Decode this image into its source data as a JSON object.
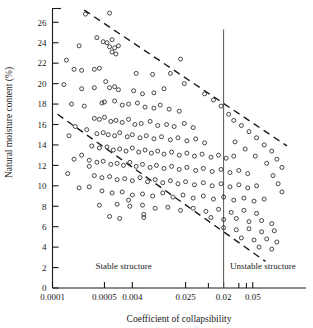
{
  "chart_data": {
    "type": "scatter",
    "title": "",
    "xlabel": "Coefficient  of  collapsibility",
    "ylabel": "Natural moisture content (%)",
    "xscale": "log-like-categorical",
    "x_ticks": [
      {
        "label": "0.0001",
        "pos": 0.0
      },
      {
        "label": "0.0005",
        "pos": 0.205
      },
      {
        "label": "0.004",
        "pos": 0.315
      },
      {
        "label": "0.025",
        "pos": 0.525
      },
      {
        "label": "0.02",
        "pos": 0.675
      },
      {
        "label": "0.05",
        "pos": 0.79
      }
    ],
    "x_minor_ticks": [
      0.615,
      0.735,
      0.765
    ],
    "y_ticks": [
      0,
      2,
      4,
      6,
      8,
      10,
      12,
      14,
      16,
      18,
      20,
      22,
      24,
      26
    ],
    "ylim": [
      0,
      27.4
    ],
    "grid": false,
    "legend": null,
    "annotations": [
      {
        "text": "Stable structure",
        "x": 0.17,
        "y": 1.9
      },
      {
        "text": "Unstable structure",
        "x": 0.7,
        "y": 1.9
      }
    ],
    "divider": {
      "label": "0.02",
      "x": 0.675,
      "y_top": 25.3,
      "y_bottom": 0
    },
    "trend_lines": [
      {
        "name": "upper-bound",
        "style": "dashed",
        "x1": 0.125,
        "y1": 27.2,
        "x2": 0.925,
        "y2": 13.9
      },
      {
        "name": "lower-bound",
        "style": "dashed",
        "x1": 0.02,
        "y1": 17.0,
        "x2": 0.84,
        "y2": 2.6
      }
    ],
    "points": [
      [
        0.13,
        26.8
      ],
      [
        0.225,
        26.9
      ],
      [
        0.175,
        24.5
      ],
      [
        0.2,
        24.1
      ],
      [
        0.215,
        24.0
      ],
      [
        0.235,
        24.3
      ],
      [
        0.225,
        23.6
      ],
      [
        0.245,
        23.5
      ],
      [
        0.26,
        23.7
      ],
      [
        0.235,
        23.1
      ],
      [
        0.25,
        22.9
      ],
      [
        0.105,
        23.7
      ],
      [
        0.055,
        22.3
      ],
      [
        0.085,
        21.4
      ],
      [
        0.115,
        21.3
      ],
      [
        0.165,
        21.4
      ],
      [
        0.185,
        21.5
      ],
      [
        0.33,
        21.0
      ],
      [
        0.395,
        20.9
      ],
      [
        0.045,
        19.9
      ],
      [
        0.115,
        19.5
      ],
      [
        0.165,
        19.6
      ],
      [
        0.21,
        20.2
      ],
      [
        0.225,
        19.6
      ],
      [
        0.245,
        19.7
      ],
      [
        0.26,
        19.4
      ],
      [
        0.32,
        19.3
      ],
      [
        0.355,
        19.0
      ],
      [
        0.4,
        19.1
      ],
      [
        0.44,
        19.5
      ],
      [
        0.075,
        18.0
      ],
      [
        0.125,
        17.8
      ],
      [
        0.195,
        18.1
      ],
      [
        0.205,
        18.2
      ],
      [
        0.245,
        18.3
      ],
      [
        0.275,
        17.9
      ],
      [
        0.3,
        18.0
      ],
      [
        0.335,
        18.1
      ],
      [
        0.365,
        17.7
      ],
      [
        0.4,
        17.6
      ],
      [
        0.425,
        17.9
      ],
      [
        0.46,
        17.5
      ],
      [
        0.5,
        17.3
      ],
      [
        0.165,
        16.6
      ],
      [
        0.185,
        16.5
      ],
      [
        0.205,
        16.7
      ],
      [
        0.23,
        16.3
      ],
      [
        0.25,
        16.4
      ],
      [
        0.275,
        16.2
      ],
      [
        0.3,
        16.5
      ],
      [
        0.325,
        16.0
      ],
      [
        0.35,
        16.1
      ],
      [
        0.385,
        16.3
      ],
      [
        0.415,
        15.9
      ],
      [
        0.45,
        16.0
      ],
      [
        0.48,
        15.8
      ],
      [
        0.52,
        16.1
      ],
      [
        0.555,
        15.7
      ],
      [
        0.09,
        15.8
      ],
      [
        0.135,
        15.5
      ],
      [
        0.175,
        15.1
      ],
      [
        0.2,
        15.2
      ],
      [
        0.22,
        15.0
      ],
      [
        0.245,
        14.9
      ],
      [
        0.265,
        15.2
      ],
      [
        0.295,
        14.8
      ],
      [
        0.315,
        15.0
      ],
      [
        0.345,
        14.7
      ],
      [
        0.37,
        14.9
      ],
      [
        0.4,
        14.6
      ],
      [
        0.43,
        14.8
      ],
      [
        0.465,
        14.5
      ],
      [
        0.495,
        14.7
      ],
      [
        0.53,
        14.4
      ],
      [
        0.565,
        14.6
      ],
      [
        0.6,
        14.2
      ],
      [
        0.155,
        13.9
      ],
      [
        0.185,
        13.7
      ],
      [
        0.215,
        13.8
      ],
      [
        0.24,
        13.5
      ],
      [
        0.265,
        13.6
      ],
      [
        0.29,
        13.4
      ],
      [
        0.315,
        13.7
      ],
      [
        0.34,
        13.3
      ],
      [
        0.365,
        13.5
      ],
      [
        0.39,
        13.2
      ],
      [
        0.415,
        13.4
      ],
      [
        0.44,
        13.1
      ],
      [
        0.47,
        13.3
      ],
      [
        0.5,
        13.0
      ],
      [
        0.53,
        13.2
      ],
      [
        0.56,
        12.9
      ],
      [
        0.59,
        13.1
      ],
      [
        0.625,
        12.8
      ],
      [
        0.655,
        13.0
      ],
      [
        0.685,
        12.7
      ],
      [
        0.715,
        12.9
      ],
      [
        0.145,
        12.5
      ],
      [
        0.175,
        12.3
      ],
      [
        0.2,
        12.4
      ],
      [
        0.23,
        12.1
      ],
      [
        0.255,
        12.2
      ],
      [
        0.28,
        12.0
      ],
      [
        0.305,
        12.3
      ],
      [
        0.33,
        11.9
      ],
      [
        0.355,
        12.1
      ],
      [
        0.385,
        11.8
      ],
      [
        0.41,
        12.0
      ],
      [
        0.44,
        11.7
      ],
      [
        0.47,
        11.9
      ],
      [
        0.5,
        11.6
      ],
      [
        0.53,
        11.8
      ],
      [
        0.565,
        11.5
      ],
      [
        0.595,
        11.7
      ],
      [
        0.63,
        11.4
      ],
      [
        0.665,
        11.6
      ],
      [
        0.7,
        11.3
      ],
      [
        0.735,
        11.5
      ],
      [
        0.77,
        11.2
      ],
      [
        0.165,
        11.0
      ],
      [
        0.195,
        10.8
      ],
      [
        0.225,
        10.9
      ],
      [
        0.255,
        10.6
      ],
      [
        0.285,
        10.7
      ],
      [
        0.315,
        10.5
      ],
      [
        0.345,
        10.8
      ],
      [
        0.375,
        10.4
      ],
      [
        0.405,
        10.6
      ],
      [
        0.435,
        10.3
      ],
      [
        0.465,
        10.5
      ],
      [
        0.495,
        10.2
      ],
      [
        0.525,
        10.4
      ],
      [
        0.56,
        10.1
      ],
      [
        0.595,
        10.3
      ],
      [
        0.63,
        10.0
      ],
      [
        0.665,
        10.2
      ],
      [
        0.7,
        9.9
      ],
      [
        0.735,
        10.1
      ],
      [
        0.77,
        9.8
      ],
      [
        0.805,
        10.0
      ],
      [
        0.195,
        9.5
      ],
      [
        0.235,
        9.3
      ],
      [
        0.275,
        9.4
      ],
      [
        0.315,
        9.1
      ],
      [
        0.355,
        9.2
      ],
      [
        0.395,
        9.0
      ],
      [
        0.435,
        9.3
      ],
      [
        0.475,
        8.9
      ],
      [
        0.515,
        9.1
      ],
      [
        0.555,
        8.8
      ],
      [
        0.595,
        9.0
      ],
      [
        0.635,
        8.7
      ],
      [
        0.675,
        8.9
      ],
      [
        0.715,
        8.6
      ],
      [
        0.755,
        8.8
      ],
      [
        0.795,
        8.5
      ],
      [
        0.835,
        8.7
      ],
      [
        0.255,
        8.2
      ],
      [
        0.305,
        8.0
      ],
      [
        0.355,
        8.1
      ],
      [
        0.405,
        7.8
      ],
      [
        0.455,
        7.9
      ],
      [
        0.505,
        7.6
      ],
      [
        0.555,
        7.8
      ],
      [
        0.605,
        7.5
      ],
      [
        0.655,
        7.7
      ],
      [
        0.705,
        7.4
      ],
      [
        0.755,
        7.6
      ],
      [
        0.805,
        7.3
      ],
      [
        0.625,
        6.9
      ],
      [
        0.675,
        6.7
      ],
      [
        0.725,
        6.8
      ],
      [
        0.775,
        6.5
      ],
      [
        0.825,
        6.6
      ],
      [
        0.865,
        6.3
      ],
      [
        0.675,
        5.9
      ],
      [
        0.725,
        5.7
      ],
      [
        0.775,
        5.8
      ],
      [
        0.825,
        5.5
      ],
      [
        0.875,
        5.6
      ],
      [
        0.745,
        4.9
      ],
      [
        0.795,
        4.7
      ],
      [
        0.845,
        4.8
      ],
      [
        0.885,
        4.5
      ],
      [
        0.815,
        4.0
      ],
      [
        0.865,
        3.8
      ],
      [
        0.105,
        9.8
      ],
      [
        0.145,
        9.9
      ],
      [
        0.185,
        8.1
      ],
      [
        0.3,
        8.6
      ],
      [
        0.145,
        11.9
      ],
      [
        0.115,
        13.0
      ],
      [
        0.065,
        14.9
      ],
      [
        0.085,
        12.6
      ],
      [
        0.06,
        11.2
      ],
      [
        0.36,
        6.9
      ],
      [
        0.36,
        7.2
      ],
      [
        0.265,
        6.8
      ],
      [
        0.225,
        7.0
      ],
      [
        0.505,
        22.4
      ],
      [
        0.465,
        21.0
      ],
      [
        0.52,
        20.0
      ],
      [
        0.6,
        19.0
      ],
      [
        0.635,
        18.4
      ],
      [
        0.665,
        17.8
      ],
      [
        0.695,
        17.0
      ],
      [
        0.715,
        16.4
      ],
      [
        0.745,
        15.9
      ],
      [
        0.775,
        15.3
      ],
      [
        0.805,
        14.7
      ],
      [
        0.835,
        14.0
      ],
      [
        0.865,
        13.4
      ],
      [
        0.885,
        12.6
      ],
      [
        0.905,
        11.8
      ],
      [
        0.87,
        11.0
      ],
      [
        0.89,
        10.2
      ],
      [
        0.905,
        9.4
      ],
      [
        0.845,
        12.2
      ],
      [
        0.8,
        12.9
      ],
      [
        0.76,
        13.6
      ],
      [
        0.72,
        14.3
      ]
    ]
  }
}
